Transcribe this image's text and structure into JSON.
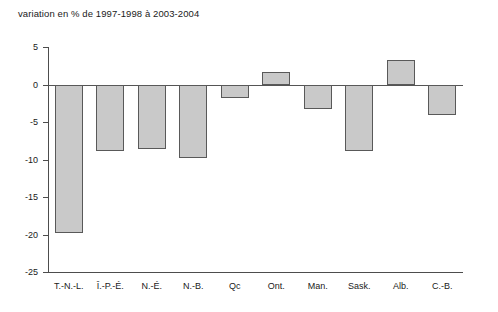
{
  "chart_data": {
    "type": "bar",
    "title": "variation en % de 1997-1998 à  2003-2004",
    "xlabel": "",
    "ylabel": "",
    "ylim": [
      -25,
      5
    ],
    "ytick_values": [
      5,
      0,
      -5,
      -10,
      -15,
      -20,
      -25
    ],
    "ytick_labels": [
      "5",
      "0",
      "-5",
      "-10",
      "-15",
      "-20",
      "-25"
    ],
    "grid": false,
    "legend": "none",
    "zero_line": true,
    "categories": [
      "T.-N.-L.",
      "Î.-P.-É.",
      "N.-É.",
      "N.-B.",
      "Qc",
      "Ont.",
      "Man.",
      "Sask.",
      "Alb.",
      "C.-B."
    ],
    "values": [
      -19.8,
      -8.9,
      -8.6,
      -9.8,
      -1.8,
      1.7,
      -3.3,
      -8.9,
      3.3,
      -4.1
    ],
    "bar_fill_color": "#c9c9c9",
    "bar_border_color": "#595959",
    "axis_color": "#4d4d4d",
    "background_color": "#ffffff"
  }
}
